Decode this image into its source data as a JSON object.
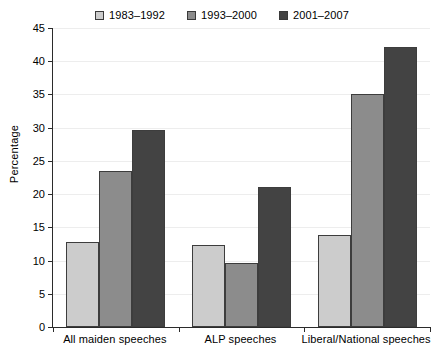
{
  "chart_data": {
    "type": "bar",
    "title": "",
    "xlabel": "",
    "ylabel": "Percentage",
    "ylim": [
      0,
      45
    ],
    "yticks": [
      0,
      5,
      10,
      15,
      20,
      25,
      30,
      35,
      40,
      45
    ],
    "grid": true,
    "legend_position": "top-center",
    "categories": [
      "All maiden speeches",
      "ALP speeches",
      "Liberal/National speeches"
    ],
    "series": [
      {
        "name": "1983–1992",
        "color": "#cccccc",
        "values": [
          12.8,
          12.4,
          13.9
        ]
      },
      {
        "name": "1993–2000",
        "color": "#8c8c8c",
        "values": [
          23.5,
          9.7,
          35.0
        ]
      },
      {
        "name": "2001–2007",
        "color": "#434343",
        "values": [
          29.6,
          21.0,
          42.2
        ]
      }
    ]
  },
  "legend": {
    "entries": [
      {
        "label": "1983–1992"
      },
      {
        "label": "1993–2000"
      },
      {
        "label": "2001–2007"
      }
    ]
  },
  "axes": {
    "y_title": "Percentage",
    "y_tick_labels": [
      "0",
      "5",
      "10",
      "15",
      "20",
      "25",
      "30",
      "35",
      "40",
      "45"
    ],
    "x_tick_labels": [
      "All maiden speeches",
      "ALP speeches",
      "Liberal/National speeches"
    ]
  }
}
